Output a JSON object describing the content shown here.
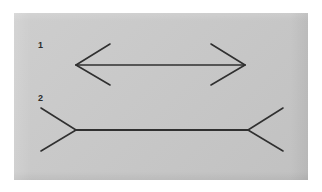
{
  "plate": {
    "background_color": "#c8c8c8",
    "page_color": "#ffffff",
    "stroke_color": "#303030",
    "width": 294,
    "height": 167,
    "offset_x": 14,
    "offset_y": 13
  },
  "figures": [
    {
      "label": "1",
      "name": "muller-lyer-arrows-in",
      "description": "double-headed arrow with inward-pointing (arrowhead) fins at both ends",
      "shaft": {
        "x1": 62,
        "y1": 52,
        "x2": 231,
        "y2": 52
      },
      "fins": [
        {
          "x1": 62,
          "y1": 52,
          "x2": 96,
          "y2": 31
        },
        {
          "x1": 62,
          "y1": 52,
          "x2": 96,
          "y2": 72
        },
        {
          "x1": 231,
          "y1": 52,
          "x2": 197,
          "y2": 31
        },
        {
          "x1": 231,
          "y1": 52,
          "x2": 197,
          "y2": 72
        }
      ],
      "label_pos": {
        "x": 24,
        "y": 28
      }
    },
    {
      "label": "2",
      "name": "muller-lyer-arrows-out",
      "description": "line with outward-pointing (feather) fins at both ends",
      "shaft": {
        "x1": 62,
        "y1": 117,
        "x2": 234,
        "y2": 117
      },
      "fins": [
        {
          "x1": 62,
          "y1": 117,
          "x2": 27,
          "y2": 95
        },
        {
          "x1": 62,
          "y1": 117,
          "x2": 27,
          "y2": 138
        },
        {
          "x1": 234,
          "y1": 117,
          "x2": 269,
          "y2": 95
        },
        {
          "x1": 234,
          "y1": 117,
          "x2": 269,
          "y2": 138
        }
      ],
      "label_pos": {
        "x": 24,
        "y": 81
      }
    }
  ],
  "labels": {
    "figure_one": "1",
    "figure_two": "2"
  }
}
